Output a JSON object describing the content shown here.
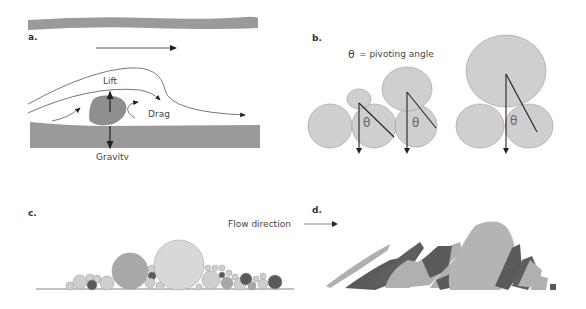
{
  "panels": {
    "a": {
      "label": "a.",
      "forces": {
        "lift": "Lift",
        "drag": "Drag",
        "gravity": "Gravity"
      }
    },
    "b": {
      "label": "b.",
      "legend_symbol": "θ",
      "legend_text": "= pivoting angle",
      "angle_symbol": "θ"
    },
    "c": {
      "label": "c."
    },
    "d": {
      "label": "d."
    },
    "flow": {
      "text": "Flow direction"
    }
  },
  "colors": {
    "bed": "#9a9a9a",
    "grain_light": "#cfcfcf",
    "grain_mid": "#a8a8a8",
    "grain_dark": "#5a5a5a",
    "line": "#333333"
  }
}
